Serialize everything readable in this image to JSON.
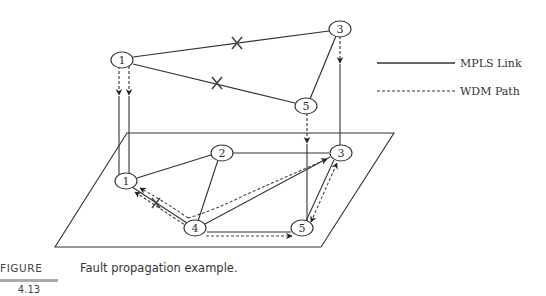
{
  "legend": {
    "mpls_link": "MPLS Link",
    "wdm_path": "WDM Path"
  },
  "upper_layer": {
    "nodes": [
      {
        "id": "1",
        "label": "1",
        "x": 122,
        "y": 60
      },
      {
        "id": "3",
        "label": "3",
        "x": 340,
        "y": 29
      },
      {
        "id": "5",
        "label": "5",
        "x": 306,
        "y": 106
      }
    ],
    "links": [
      {
        "from": "1",
        "to": "3",
        "failed": true
      },
      {
        "from": "1",
        "to": "5",
        "failed": true
      },
      {
        "from": "3",
        "to": "5",
        "failed": false
      }
    ]
  },
  "lower_layer": {
    "nodes": [
      {
        "id": "1p",
        "label": "1",
        "x": 126,
        "y": 181
      },
      {
        "id": "2",
        "label": "2",
        "x": 222,
        "y": 153
      },
      {
        "id": "3p",
        "label": "3",
        "x": 341,
        "y": 153
      },
      {
        "id": "4",
        "label": "4",
        "x": 195,
        "y": 228
      },
      {
        "id": "5p",
        "label": "5",
        "x": 302,
        "y": 228
      }
    ],
    "links": [
      {
        "from": "1p",
        "to": "2"
      },
      {
        "from": "1p",
        "to": "4",
        "failed": true
      },
      {
        "from": "2",
        "to": "3p"
      },
      {
        "from": "2",
        "to": "4"
      },
      {
        "from": "4",
        "to": "3p"
      },
      {
        "from": "4",
        "to": "5p"
      },
      {
        "from": "5p",
        "to": "3p"
      }
    ]
  },
  "caption": {
    "figure_label": "FIGURE",
    "figure_number": "4.13",
    "text": "Fault propagation example."
  }
}
